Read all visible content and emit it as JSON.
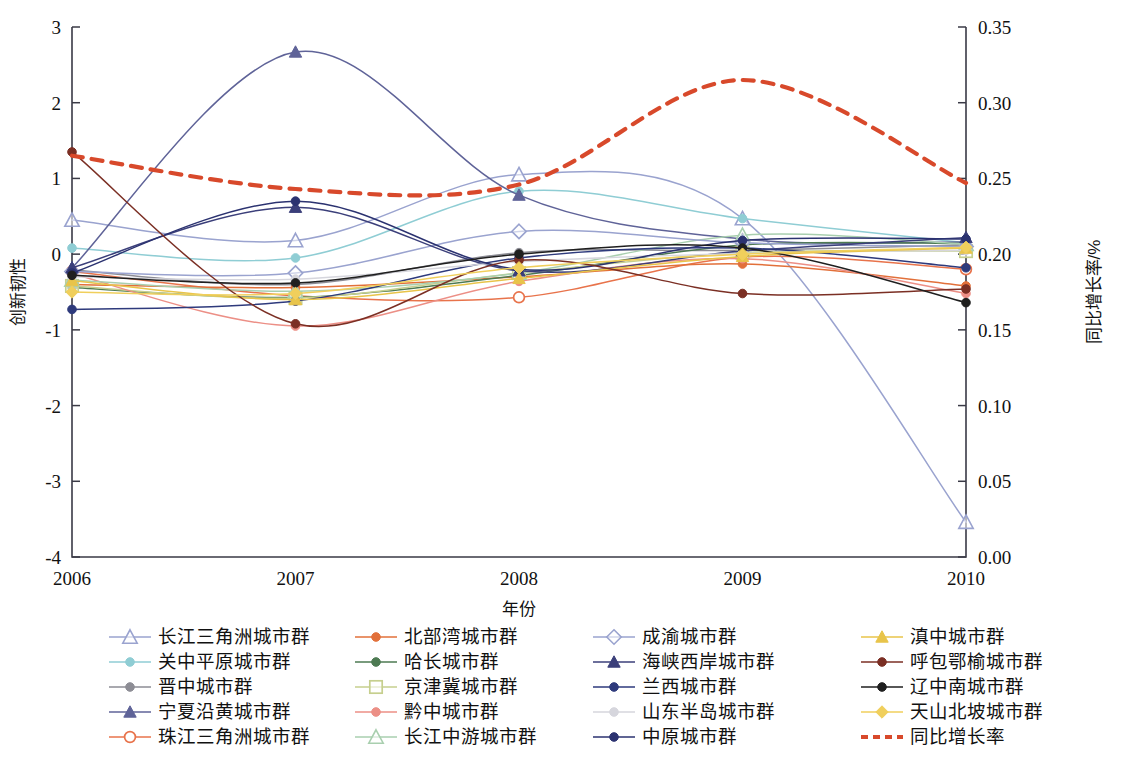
{
  "chart_data": {
    "type": "line",
    "title": "",
    "xlabel": "年份",
    "ylabel": "创新韧性",
    "y2label": "同比增长率/%",
    "x": [
      "2006",
      "2007",
      "2008",
      "2009",
      "2010"
    ],
    "xtick_labels": [
      "2006",
      "2007",
      "2008",
      "2009",
      "2010"
    ],
    "ytick_labels": [
      "3",
      "2",
      "1",
      "0",
      "-1",
      "-2",
      "-3",
      "-4"
    ],
    "ytick_values": [
      3,
      2,
      1,
      0,
      -1,
      -2,
      -3,
      -4
    ],
    "ylim": [
      -4,
      3
    ],
    "y2tick_labels": [
      "0.35",
      "0.30",
      "0.25",
      "0.20",
      "0.15",
      "0.10",
      "0.05",
      "0.00"
    ],
    "y2tick_values": [
      0.35,
      0.3,
      0.25,
      0.2,
      0.15,
      0.1,
      0.05,
      0.0
    ],
    "y2lim": [
      0.0,
      0.35
    ],
    "grid": false,
    "legend_position": "bottom",
    "series": [
      {
        "name": "长江三角洲城市群",
        "axis": "left",
        "color": "#9aa3cf",
        "marker": "triangle-open",
        "values": [
          0.45,
          0.18,
          1.05,
          0.47,
          -3.54
        ]
      },
      {
        "name": "关中平原城市群",
        "axis": "left",
        "color": "#8fcdd4",
        "marker": "circle",
        "values": [
          0.08,
          -0.05,
          0.83,
          0.47,
          0.15
        ]
      },
      {
        "name": "晋中城市群",
        "axis": "left",
        "color": "#8d8d95",
        "marker": "circle",
        "values": [
          -0.21,
          -0.4,
          0.02,
          0.05,
          0.12
        ]
      },
      {
        "name": "宁夏沿黄城市群",
        "axis": "left",
        "color": "#5f6398",
        "marker": "triangle",
        "values": [
          -0.18,
          2.67,
          0.78,
          0.2,
          0.16
        ]
      },
      {
        "name": "珠江三角洲城市群",
        "axis": "left",
        "color": "#e8734b",
        "marker": "circle-open",
        "values": [
          -0.23,
          -0.55,
          -0.57,
          -0.04,
          -0.2
        ]
      },
      {
        "name": "北部湾城市群",
        "axis": "left",
        "color": "#e2703a",
        "marker": "circle",
        "values": [
          -0.4,
          -0.44,
          -0.3,
          -0.13,
          -0.42
        ]
      },
      {
        "name": "哈长城市群",
        "axis": "left",
        "color": "#4d7a52",
        "marker": "circle",
        "values": [
          -0.44,
          -0.57,
          -0.28,
          0.12,
          0.14
        ]
      },
      {
        "name": "京津冀城市群",
        "axis": "left",
        "color": "#c6cf8e",
        "marker": "square-open",
        "values": [
          -0.42,
          -0.58,
          -0.25,
          0.02,
          0.04
        ]
      },
      {
        "name": "黔中城市群",
        "axis": "left",
        "color": "#ec8f86",
        "marker": "circle",
        "values": [
          -0.26,
          -0.95,
          -0.36,
          -0.06,
          -0.52
        ]
      },
      {
        "name": "长江中游城市群",
        "axis": "left",
        "color": "#a9cfaf",
        "marker": "triangle-open",
        "values": [
          -0.34,
          -0.49,
          -0.25,
          0.25,
          0.13
        ]
      },
      {
        "name": "成渝城市群",
        "axis": "left",
        "color": "#9aa3cf",
        "marker": "diamond-open",
        "values": [
          -0.23,
          -0.25,
          0.3,
          0.15,
          0.1
        ]
      },
      {
        "name": "海峡西岸城市群",
        "axis": "left",
        "color": "#3b3f7a",
        "marker": "triangle",
        "values": [
          -0.18,
          0.62,
          -0.22,
          0.04,
          0.22
        ]
      },
      {
        "name": "兰西城市群",
        "axis": "left",
        "color": "#2e3a7c",
        "marker": "circle",
        "values": [
          -0.73,
          -0.62,
          -0.05,
          0.08,
          -0.18
        ]
      },
      {
        "name": "山东半岛城市群",
        "axis": "left",
        "color": "#d6d6dd",
        "marker": "circle",
        "values": [
          -0.3,
          -0.33,
          -0.1,
          0.01,
          0.05
        ]
      },
      {
        "name": "中原城市群",
        "axis": "left",
        "color": "#2b3270",
        "marker": "circle",
        "values": [
          -0.25,
          0.7,
          -0.2,
          0.18,
          0.2
        ]
      },
      {
        "name": "滇中城市群",
        "axis": "left",
        "color": "#e8c44a",
        "marker": "triangle",
        "values": [
          -0.35,
          -0.6,
          -0.32,
          -0.03,
          0.08
        ]
      },
      {
        "name": "呼包鄂榆城市群",
        "axis": "left",
        "color": "#7b2f24",
        "marker": "circle",
        "values": [
          1.35,
          -0.92,
          -0.08,
          -0.52,
          -0.46
        ]
      },
      {
        "name": "辽中南城市群",
        "axis": "left",
        "color": "#1f1f1f",
        "marker": "circle",
        "values": [
          -0.28,
          -0.38,
          0.0,
          0.08,
          -0.64
        ]
      },
      {
        "name": "天山北坡城市群",
        "axis": "left",
        "color": "#f0cf5c",
        "marker": "diamond",
        "values": [
          -0.5,
          -0.52,
          -0.18,
          0.0,
          0.09
        ]
      },
      {
        "name": "同比增长率",
        "axis": "right",
        "color": "#d8492b",
        "marker": "none",
        "dashed": true,
        "values": [
          0.265,
          0.243,
          0.246,
          0.315,
          0.247
        ]
      }
    ]
  },
  "legend": {
    "rows": [
      [
        {
          "label": "长江三角洲城市群",
          "color": "#9aa3cf",
          "marker": "triangle-open",
          "dashed": false
        },
        {
          "label": "北部湾城市群",
          "color": "#e2703a",
          "marker": "circle",
          "dashed": false
        },
        {
          "label": "成渝城市群",
          "color": "#9aa3cf",
          "marker": "diamond-open",
          "dashed": false
        },
        {
          "label": "滇中城市群",
          "color": "#e8c44a",
          "marker": "triangle",
          "dashed": false
        }
      ],
      [
        {
          "label": "关中平原城市群",
          "color": "#8fcdd4",
          "marker": "circle",
          "dashed": false
        },
        {
          "label": "哈长城市群",
          "color": "#4d7a52",
          "marker": "circle",
          "dashed": false
        },
        {
          "label": "海峡西岸城市群",
          "color": "#3b3f7a",
          "marker": "triangle",
          "dashed": false
        },
        {
          "label": "呼包鄂榆城市群",
          "color": "#7b2f24",
          "marker": "circle",
          "dashed": false
        }
      ],
      [
        {
          "label": "晋中城市群",
          "color": "#8d8d95",
          "marker": "circle",
          "dashed": false
        },
        {
          "label": "京津冀城市群",
          "color": "#c6cf8e",
          "marker": "square-open",
          "dashed": false
        },
        {
          "label": "兰西城市群",
          "color": "#2e3a7c",
          "marker": "circle",
          "dashed": false
        },
        {
          "label": "辽中南城市群",
          "color": "#1f1f1f",
          "marker": "circle",
          "dashed": false
        }
      ],
      [
        {
          "label": "宁夏沿黄城市群",
          "color": "#5f6398",
          "marker": "triangle",
          "dashed": false
        },
        {
          "label": "黔中城市群",
          "color": "#ec8f86",
          "marker": "circle",
          "dashed": false
        },
        {
          "label": "山东半岛城市群",
          "color": "#d6d6dd",
          "marker": "circle",
          "dashed": false
        },
        {
          "label": "天山北坡城市群",
          "color": "#f0cf5c",
          "marker": "diamond",
          "dashed": false
        }
      ],
      [
        {
          "label": "珠江三角洲城市群",
          "color": "#e8734b",
          "marker": "circle-open",
          "dashed": false
        },
        {
          "label": "长江中游城市群",
          "color": "#a9cfaf",
          "marker": "triangle-open",
          "dashed": false
        },
        {
          "label": "中原城市群",
          "color": "#2b3270",
          "marker": "circle",
          "dashed": false
        },
        {
          "label": "同比增长率",
          "color": "#d8492b",
          "marker": "none",
          "dashed": true
        }
      ]
    ]
  },
  "colors": {
    "axis": "#3a3a46",
    "growth_rate_line": "#d8492b",
    "background": "#ffffff"
  }
}
